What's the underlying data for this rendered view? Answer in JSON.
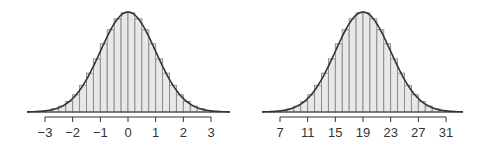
{
  "chart_data": [
    {
      "type": "bar",
      "subtype": "histogram_with_normal_curve",
      "title": "",
      "xlabel": "",
      "ylabel": "",
      "distribution": {
        "mean": 0,
        "sd": 1
      },
      "bin_width": 0.25,
      "xlim": [
        -3.6,
        3.7
      ],
      "xticks": [
        -3,
        -2,
        -1,
        0,
        1,
        2,
        3
      ],
      "xtick_labels": [
        "−3",
        "−2",
        "−1",
        "0",
        "1",
        "2",
        "3"
      ],
      "grid": false,
      "legend": null
    },
    {
      "type": "bar",
      "subtype": "histogram_with_normal_curve",
      "title": "",
      "xlabel": "",
      "ylabel": "",
      "distribution": {
        "mean": 19,
        "sd": 4
      },
      "bin_width": 1,
      "xlim": [
        4.5,
        33.5
      ],
      "xticks": [
        7,
        11,
        15,
        19,
        23,
        27,
        31
      ],
      "xtick_labels": [
        "7",
        "11",
        "15",
        "19",
        "23",
        "27",
        "31"
      ],
      "grid": false,
      "legend": null
    }
  ],
  "colors": {
    "bar_fill": "#e8e8e8",
    "bar_stroke": "#888888",
    "curve": "#333333",
    "axis": "#333333"
  }
}
